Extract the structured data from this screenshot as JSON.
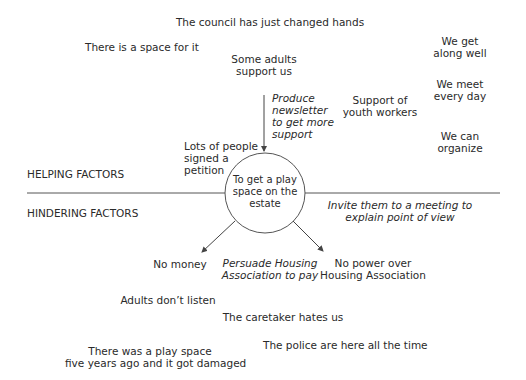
{
  "diagram": {
    "goal": [
      "To get a play",
      "space on the",
      "estate"
    ],
    "sections": {
      "helping_label": "HELPING FACTORS",
      "hindering_label": "HINDERING FACTORS"
    },
    "helping_factors": [
      {
        "id": "council",
        "lines": [
          "The council has just changed hands"
        ]
      },
      {
        "id": "space",
        "lines": [
          "There is a space for it"
        ]
      },
      {
        "id": "adults-support",
        "lines": [
          "Some adults",
          "support us"
        ]
      },
      {
        "id": "petition",
        "lines": [
          "Lots of people",
          "signed a",
          "petition"
        ]
      },
      {
        "id": "youth-workers",
        "lines": [
          "Support of",
          "youth workers"
        ]
      },
      {
        "id": "get-along",
        "lines": [
          "We get",
          "along well"
        ]
      },
      {
        "id": "meet",
        "lines": [
          "We meet",
          "every day"
        ]
      },
      {
        "id": "organize",
        "lines": [
          "We can",
          "organize"
        ]
      }
    ],
    "actions": [
      {
        "id": "newsletter",
        "lines": [
          "Produce",
          "newsletter",
          "to get more",
          "support"
        ]
      },
      {
        "id": "invite",
        "lines": [
          "Invite them to a meeting to",
          "explain point of view"
        ]
      },
      {
        "id": "persuade",
        "lines": [
          "Persuade Housing",
          "Association to pay"
        ]
      }
    ],
    "hindering_factors": [
      {
        "id": "no-money",
        "lines": [
          "No money"
        ]
      },
      {
        "id": "no-power",
        "lines": [
          "No power over",
          "Housing Association"
        ]
      },
      {
        "id": "adults-dont-listen",
        "lines": [
          "Adults don’t listen"
        ]
      },
      {
        "id": "caretaker",
        "lines": [
          "The caretaker hates us"
        ]
      },
      {
        "id": "play-space-damaged",
        "lines": [
          "There was a play space",
          "five years ago and it got damaged"
        ]
      },
      {
        "id": "police",
        "lines": [
          "The police are here all the time"
        ]
      }
    ],
    "colors": {
      "line": "#555555",
      "text": "#2a2a2a",
      "background": "#ffffff"
    }
  }
}
